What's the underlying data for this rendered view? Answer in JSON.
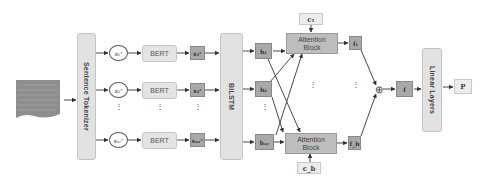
{
  "diagram": {
    "type": "model-architecture",
    "input": {
      "label": "document",
      "icon": "document-icon"
    },
    "sentence_tokenizer": {
      "label": "Sentence Tokenizer"
    },
    "sentences": [
      {
        "label": "s₁ʳ"
      },
      {
        "label": "s₂ʳ"
      },
      {
        "label": "sₙᵣʳ"
      }
    ],
    "bert": [
      {
        "label": "BERT"
      },
      {
        "label": "BERT"
      },
      {
        "label": "BERT"
      }
    ],
    "sentence_embeddings": [
      {
        "label": "s₁ʳ"
      },
      {
        "label": "s₂ʳ"
      },
      {
        "label": "sₙᵣʳ"
      }
    ],
    "bilstm": {
      "label": "BiLSTM"
    },
    "hidden_states": [
      {
        "label": "h₁"
      },
      {
        "label": "h₂"
      },
      {
        "label": "hₙᵣ"
      }
    ],
    "attention_blocks": [
      {
        "label_line1": "Attention",
        "label_line2": "Block",
        "context": "c₁",
        "output": "f₁"
      },
      {
        "label_line1": "Attention",
        "label_line2": "Block",
        "context": "c_b",
        "output": "f_b"
      }
    ],
    "concat": {
      "symbol": "⊕",
      "icon": "concat-icon"
    },
    "fused": {
      "label": "f"
    },
    "linear_layers": {
      "label": "Linear Layers"
    },
    "output": {
      "label": "P"
    },
    "ellipsis": "⋮"
  }
}
